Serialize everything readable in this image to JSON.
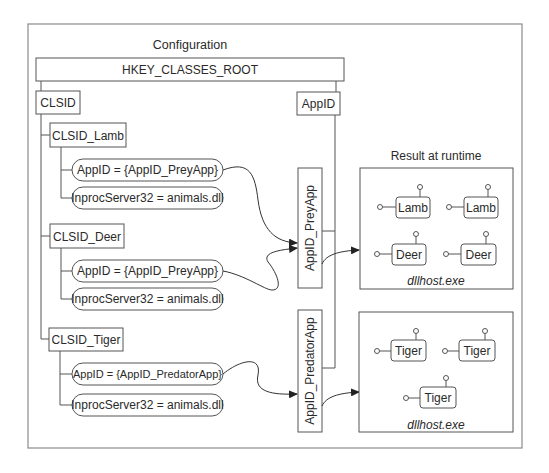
{
  "configuration": {
    "title": "Configuration",
    "root_key": "HKEY_CLASSES_ROOT",
    "clsid_key": "CLSID",
    "appid_key": "AppID",
    "classes": [
      {
        "name": "CLSID_Lamb",
        "values": [
          "AppID = {AppID_PreyApp}",
          "InprocServer32 = animals.dll"
        ],
        "target_appid": "AppID_PreyApp"
      },
      {
        "name": "CLSID_Deer",
        "values": [
          "AppID = {AppID_PreyApp}",
          "InprocServer32 = animals.dll"
        ],
        "target_appid": "AppID_PreyApp"
      },
      {
        "name": "CLSID_Tiger",
        "values": [
          "AppID = {AppID_PredatorApp}",
          "InprocServer32 = animals.dll"
        ],
        "target_appid": "AppID_PredatorApp"
      }
    ],
    "appids": [
      "AppID_PreyApp",
      "AppID_PredatorApp"
    ]
  },
  "runtime": {
    "title": "Result at runtime",
    "processes": [
      {
        "name": "dllhost.exe",
        "objects": [
          "Lamb",
          "Lamb",
          "Deer",
          "Deer"
        ]
      },
      {
        "name": "dllhost.exe",
        "objects": [
          "Tiger",
          "Tiger",
          "Tiger"
        ]
      }
    ]
  }
}
